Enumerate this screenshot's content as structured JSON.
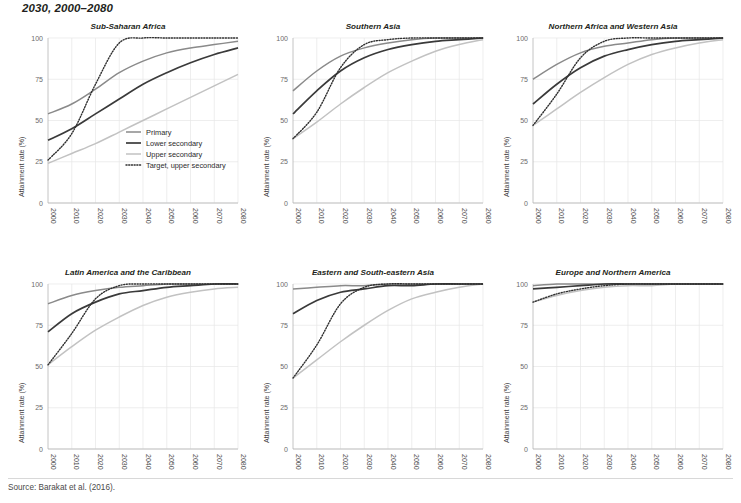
{
  "headline": "2030, 2000–2080",
  "source": "Source: Barakat et al. (2016).",
  "axis": {
    "ylabel": "Attainment rate (%)",
    "yticks": [
      "0",
      "25",
      "50",
      "75",
      "100"
    ],
    "xticks": [
      "2000",
      "2010",
      "2020",
      "2030",
      "2040",
      "2050",
      "2060",
      "2070",
      "2080"
    ]
  },
  "legend": {
    "items": [
      {
        "label": "Primary",
        "key": "primary",
        "color": "#8a8a8a",
        "style": "solid"
      },
      {
        "label": "Lower secondary",
        "key": "lower",
        "color": "#3a3a3a",
        "style": "solid"
      },
      {
        "label": "Upper secondary",
        "key": "upper",
        "color": "#c2c2c2",
        "style": "solid"
      },
      {
        "label": "Target, upper secondary",
        "key": "target",
        "color": "#2f2f2f",
        "style": "dotted"
      }
    ]
  },
  "chart_data": {
    "type": "line",
    "title": "2030, 2000–2080",
    "xlabel": "",
    "ylabel": "Attainment rate (%)",
    "xlim": [
      2000,
      2080
    ],
    "ylim": [
      0,
      100
    ],
    "grid": true,
    "legend_position": "inside-bottom-right-panel-1",
    "x": [
      2000,
      2010,
      2020,
      2030,
      2040,
      2050,
      2060,
      2070,
      2080
    ],
    "panels": [
      {
        "title": "Sub-Saharan Africa",
        "series": [
          {
            "name": "Primary",
            "values": [
              54,
              60,
              69,
              79,
              86,
              91,
              94,
              96,
              98
            ]
          },
          {
            "name": "Lower secondary",
            "values": [
              38,
              45,
              54,
              63,
              72,
              79,
              85,
              90,
              94
            ]
          },
          {
            "name": "Upper secondary",
            "values": [
              24,
              30,
              36,
              43,
              50,
              57,
              64,
              71,
              78
            ]
          },
          {
            "name": "Target, upper secondary",
            "values": [
              26,
              42,
              72,
              97,
              100,
              100,
              100,
              100,
              100
            ]
          }
        ]
      },
      {
        "title": "Southern Asia",
        "series": [
          {
            "name": "Primary",
            "values": [
              68,
              80,
              89,
              94,
              97,
              99,
              100,
              100,
              100
            ]
          },
          {
            "name": "Lower secondary",
            "values": [
              54,
              68,
              80,
              88,
              93,
              96,
              98,
              99,
              100
            ]
          },
          {
            "name": "Upper secondary",
            "values": [
              39,
              49,
              60,
              70,
              79,
              86,
              92,
              96,
              99
            ]
          },
          {
            "name": "Target, upper secondary",
            "values": [
              39,
              55,
              82,
              96,
              99,
              100,
              100,
              100,
              100
            ]
          }
        ]
      },
      {
        "title": "Northern Africa and Western Asia",
        "series": [
          {
            "name": "Primary",
            "values": [
              75,
              84,
              91,
              95,
              97,
              99,
              100,
              100,
              100
            ]
          },
          {
            "name": "Lower secondary",
            "values": [
              60,
              72,
              82,
              89,
              93,
              96,
              98,
              99,
              100
            ]
          },
          {
            "name": "Upper secondary",
            "values": [
              47,
              57,
              67,
              76,
              84,
              90,
              94,
              97,
              99
            ]
          },
          {
            "name": "Target, upper secondary",
            "values": [
              47,
              66,
              88,
              98,
              100,
              100,
              100,
              100,
              100
            ]
          }
        ]
      },
      {
        "title": "Latin America and the Caribbean",
        "series": [
          {
            "name": "Primary",
            "values": [
              88,
              93,
              96,
              98,
              99,
              100,
              100,
              100,
              100
            ]
          },
          {
            "name": "Lower secondary",
            "values": [
              71,
              82,
              89,
              94,
              96,
              98,
              99,
              100,
              100
            ]
          },
          {
            "name": "Upper secondary",
            "values": [
              51,
              62,
              72,
              80,
              87,
              92,
              95,
              97,
              98
            ]
          },
          {
            "name": "Target, upper secondary",
            "values": [
              51,
              70,
              91,
              99,
              100,
              100,
              100,
              100,
              100
            ]
          }
        ]
      },
      {
        "title": "Eastern and South-eastern Asia",
        "series": [
          {
            "name": "Primary",
            "values": [
              97,
              98,
              99,
              99,
              100,
              100,
              100,
              100,
              100
            ]
          },
          {
            "name": "Lower secondary",
            "values": [
              82,
              90,
              95,
              97,
              99,
              99,
              100,
              100,
              100
            ]
          },
          {
            "name": "Upper secondary",
            "values": [
              43,
              54,
              65,
              75,
              84,
              91,
              95,
              98,
              100
            ]
          },
          {
            "name": "Target, upper secondary",
            "values": [
              43,
              63,
              88,
              98,
              100,
              100,
              100,
              100,
              100
            ]
          }
        ]
      },
      {
        "title": "Europe and Northern America",
        "series": [
          {
            "name": "Primary",
            "values": [
              99,
              100,
              100,
              100,
              100,
              100,
              100,
              100,
              100
            ]
          },
          {
            "name": "Lower secondary",
            "values": [
              97,
              98,
              99,
              100,
              100,
              100,
              100,
              100,
              100
            ]
          },
          {
            "name": "Upper secondary",
            "values": [
              89,
              93,
              96,
              98,
              99,
              99,
              100,
              100,
              100
            ]
          },
          {
            "name": "Target, upper secondary",
            "values": [
              89,
              94,
              97,
              99,
              100,
              100,
              100,
              100,
              100
            ]
          }
        ]
      }
    ]
  }
}
